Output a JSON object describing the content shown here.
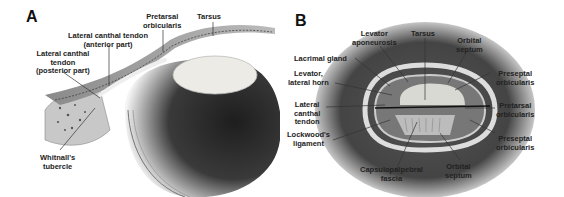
{
  "panels": [
    {
      "id": "A",
      "label": "A",
      "annotations": {
        "pretarsal_orbicularis": "Pretarsal\norbicularis",
        "tarsus": "Tarsus",
        "lct_anterior": "Lateral canthal tendon\n(anterior part)",
        "lct_posterior": "Lateral canthal\ntendon\n(posterior part)",
        "whitnalls_tubercle": "Whitnall's\ntubercle"
      }
    },
    {
      "id": "B",
      "label": "B",
      "annotations": {
        "levator_aponeurosis": "Levator\naponeurosis",
        "tarsus": "Tarsus",
        "orbital_septum_top": "Orbital\nseptum",
        "lacrimal_gland": "Lacrimal gland",
        "levator_lateral_horn": "Levator,\nlateral horn",
        "preseptal_orbicularis_top": "Preseptal\norbicularis",
        "lateral_canthal_tendon": "Lateral\ncanthal\ntendon",
        "pretarsal_orbicularis": "Pretarsal\norbicularis",
        "lockwoods_ligament": "Lockwood's\nligament",
        "preseptal_orbicularis_bottom": "Preseptal\norbicularis",
        "capsulopalpebral_fascia": "Capsulopalpebral\nfascia",
        "orbital_septum_bottom": "Orbital\nseptum"
      }
    }
  ],
  "colors": {
    "label_text": "#222222",
    "leader_line": "#333333",
    "globe_dark": "#2a2a2a",
    "lens": "#e8e6e0",
    "tissue": "#9a9a9a"
  }
}
